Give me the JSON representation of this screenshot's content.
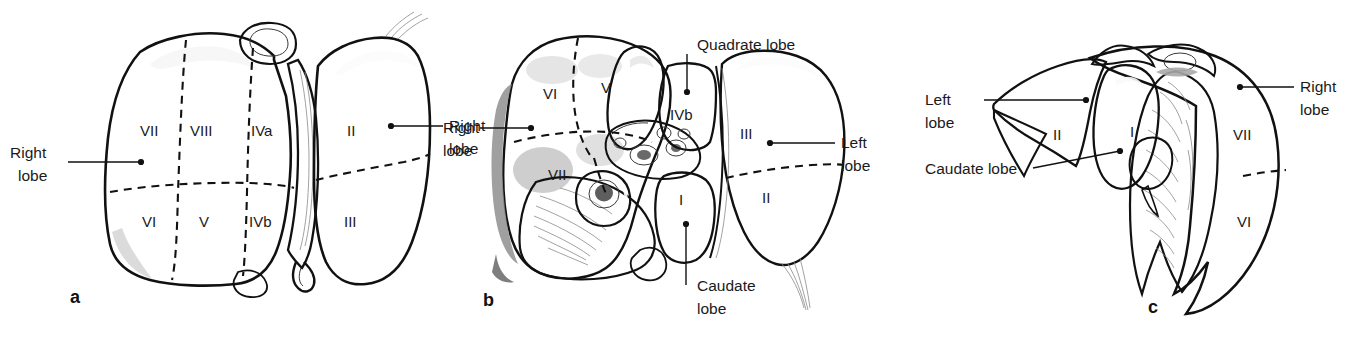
{
  "figure": {
    "background": "#ffffff",
    "ink": "#111111",
    "width": 1363,
    "height": 345
  },
  "panels": [
    {
      "id": "a",
      "letter": "a",
      "view": "anterior",
      "callouts": [
        {
          "key": "right_lobe_left",
          "text_line1": "Right",
          "text_line2": "lobe"
        },
        {
          "key": "right_lobe_right",
          "text_line1": "Right",
          "text_line2": "lobe"
        }
      ],
      "segments": [
        "VII",
        "VIII",
        "IVa",
        "II",
        "VI",
        "V",
        "IVb",
        "III"
      ]
    },
    {
      "id": "b",
      "letter": "b",
      "view": "visceral / inferior",
      "callouts": [
        {
          "key": "right_lobe",
          "text_line1": "Right",
          "text_line2": "lobe"
        },
        {
          "key": "quadrate_lobe",
          "text_line1": "Quadrate lobe",
          "text_line2": ""
        },
        {
          "key": "left_lobe",
          "text_line1": "Left",
          "text_line2": "lobe"
        },
        {
          "key": "caudate_lobe",
          "text_line1": "Caudate",
          "text_line2": "lobe"
        }
      ],
      "segments": [
        "VI",
        "V",
        "IVb",
        "VII",
        "I",
        "III",
        "II"
      ]
    },
    {
      "id": "c",
      "letter": "c",
      "view": "left lateral",
      "callouts": [
        {
          "key": "left_lobe",
          "text_line1": "Left",
          "text_line2": "lobe"
        },
        {
          "key": "caudate_lobe",
          "text_line1": "Caudate lobe",
          "text_line2": ""
        },
        {
          "key": "right_lobe",
          "text_line1": "Right",
          "text_line2": "lobe"
        }
      ],
      "segments": [
        "II",
        "I",
        "VII",
        "VI"
      ]
    }
  ],
  "labels": {
    "a": {
      "right_lobe_left_1": "Right",
      "right_lobe_left_2": "lobe",
      "right_lobe_right_1": "Right",
      "right_lobe_right_2": "lobe",
      "seg_vii": "VII",
      "seg_viii": "VIII",
      "seg_iva": "IVa",
      "seg_ii": "II",
      "seg_vi": "VI",
      "seg_v": "V",
      "seg_ivb": "IVb",
      "seg_iii": "III",
      "letter": "a"
    },
    "b": {
      "right_lobe_1": "Right",
      "right_lobe_2": "lobe",
      "quadrate_lobe": "Quadrate lobe",
      "left_lobe_1": "Left",
      "left_lobe_2": "lobe",
      "caudate_lobe_1": "Caudate",
      "caudate_lobe_2": "lobe",
      "seg_vi": "VI",
      "seg_v": "V",
      "seg_ivb": "IVb",
      "seg_vii": "VII",
      "seg_i": "I",
      "seg_iii": "III",
      "seg_ii": "II",
      "letter": "b"
    },
    "c": {
      "left_lobe_1": "Left",
      "left_lobe_2": "lobe",
      "caudate_lobe": "Caudate lobe",
      "right_lobe_1": "Right",
      "right_lobe_2": "lobe",
      "seg_ii": "II",
      "seg_i": "I",
      "seg_vii": "VII",
      "seg_vi": "VI",
      "letter": "c"
    }
  }
}
